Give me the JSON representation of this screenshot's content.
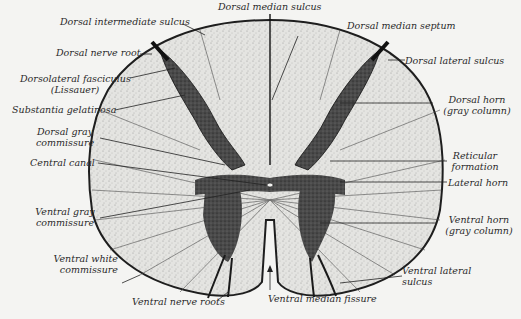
{
  "figure": {
    "colors": {
      "background": "#f4f4f2",
      "white_matter": "#e6e6e3",
      "gray_matter": "#3a3a3a",
      "ink": "#1e1e1e"
    }
  },
  "labels": {
    "dorsal_median_sulcus": "Dorsal median sulcus",
    "dorsal_intermediate_sulcus": "Dorsal intermediate sulcus",
    "dorsal_median_septum": "Dorsal median septum",
    "dorsal_nerve_root": "Dorsal nerve root",
    "dorsal_lateral_sulcus": "Dorsal lateral sulcus",
    "dorsolateral_fasciculus_1": "Dorsolateral fasciculus",
    "dorsolateral_fasciculus_2": "(Lissauer)",
    "substantia_gelatinosa": "Substantia gelatinosa",
    "dorsal_horn_1": "Dorsal horn",
    "dorsal_horn_2": "(gray column)",
    "dorsal_gray_commissure_1": "Dorsal gray",
    "dorsal_gray_commissure_2": "commissure",
    "central_canal": "Central canal",
    "reticular_formation_1": "Reticular",
    "reticular_formation_2": "formation",
    "lateral_horn": "Lateral horn",
    "ventral_gray_commissure_1": "Ventral gray",
    "ventral_gray_commissure_2": "commissure",
    "ventral_horn_1": "Ventral horn",
    "ventral_horn_2": "(gray column)",
    "ventral_white_commissure_1": "Ventral white",
    "ventral_white_commissure_2": "commissure",
    "ventral_lateral_sulcus_1": "Ventral lateral",
    "ventral_lateral_sulcus_2": "sulcus",
    "ventral_nerve_roots": "Ventral nerve roots",
    "ventral_median_fissure": "Ventral median fissure"
  }
}
